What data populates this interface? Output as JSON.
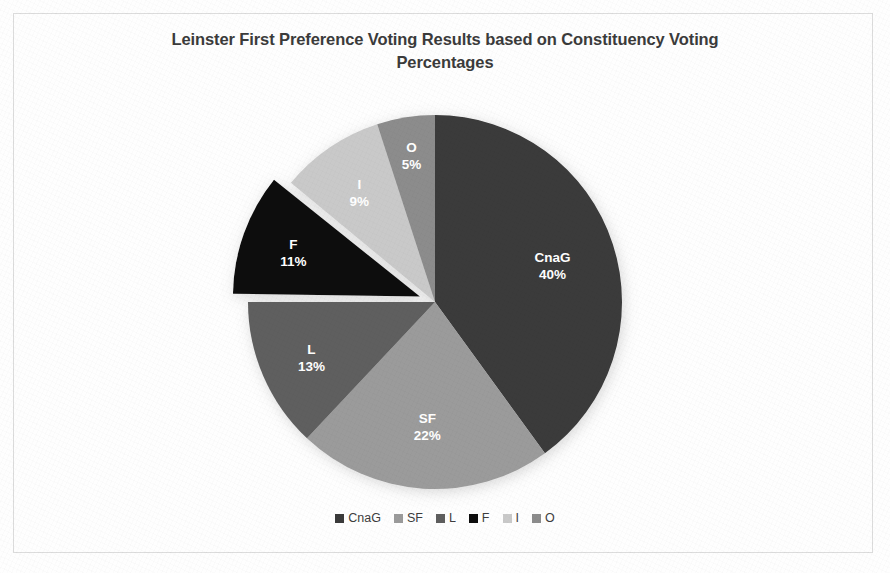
{
  "chart_data": {
    "type": "pie",
    "title": "Leinster First Preference Voting Results based on Constituency Voting Percentages",
    "title_line1": "Leinster First Preference Voting Results based on Constituency Voting",
    "title_line2": "Percentages",
    "unit": "%",
    "categories": [
      "CnaG",
      "SF",
      "L",
      "F",
      "I",
      "O"
    ],
    "values": [
      40,
      22,
      13,
      11,
      9,
      5
    ],
    "slice_labels": [
      "CnaG",
      "SF",
      "L",
      "F",
      "I",
      "O"
    ],
    "value_labels": [
      "40%",
      "22%",
      "13%",
      "11%",
      "9%",
      "5%"
    ],
    "colors": [
      "#3a3a3a",
      "#9b9b9b",
      "#5e5e5e",
      "#0d0d0d",
      "#c9c9c9",
      "#8c8c8c"
    ],
    "label_color": "#ffffff",
    "start_angle_deg": 0,
    "direction": "clockwise",
    "exploded_slices": [
      "F"
    ],
    "legend_position": "bottom",
    "grid": false,
    "slices": [
      {
        "name": "CnaG",
        "value": 40,
        "label": "CnaG",
        "value_label": "40%",
        "color": "#3a3a3a",
        "exploded": false
      },
      {
        "name": "SF",
        "value": 22,
        "label": "SF",
        "value_label": "22%",
        "color": "#9b9b9b",
        "exploded": false
      },
      {
        "name": "L",
        "value": 13,
        "label": "L",
        "value_label": "13%",
        "color": "#5e5e5e",
        "exploded": false
      },
      {
        "name": "F",
        "value": 11,
        "label": "F",
        "value_label": "11%",
        "color": "#0d0d0d",
        "exploded": true
      },
      {
        "name": "I",
        "value": 9,
        "label": "I",
        "value_label": "9%",
        "color": "#c9c9c9",
        "exploded": false
      },
      {
        "name": "O",
        "value": 5,
        "label": "O",
        "value_label": "5%",
        "color": "#8c8c8c",
        "exploded": false
      }
    ]
  },
  "legend": {
    "items": [
      {
        "label": "CnaG",
        "color": "#3a3a3a"
      },
      {
        "label": "SF",
        "color": "#9b9b9b"
      },
      {
        "label": "L",
        "color": "#5e5e5e"
      },
      {
        "label": "F",
        "color": "#0d0d0d"
      },
      {
        "label": "I",
        "color": "#c9c9c9"
      },
      {
        "label": "O",
        "color": "#8c8c8c"
      }
    ]
  },
  "frame": {
    "border_color": "#dcdcdc",
    "background_color": "#fefefe"
  }
}
